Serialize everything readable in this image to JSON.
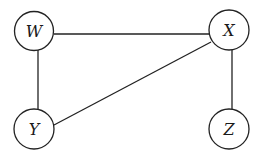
{
  "diagram": {
    "type": "undirected-graph",
    "nodes": [
      {
        "id": "W",
        "label": "W",
        "cx": 34,
        "cy": 31,
        "r": 19.5
      },
      {
        "id": "X",
        "label": "X",
        "cx": 229,
        "cy": 30,
        "r": 20
      },
      {
        "id": "Y",
        "label": "Y",
        "cx": 34,
        "cy": 129,
        "r": 20
      },
      {
        "id": "Z",
        "label": "Z",
        "cx": 229,
        "cy": 129,
        "r": 20
      }
    ],
    "edges": [
      {
        "from": "W",
        "to": "X"
      },
      {
        "from": "W",
        "to": "Y"
      },
      {
        "from": "X",
        "to": "Y"
      },
      {
        "from": "X",
        "to": "Z"
      }
    ],
    "stroke_color": "#222222",
    "fill_color": "#ffffff"
  }
}
